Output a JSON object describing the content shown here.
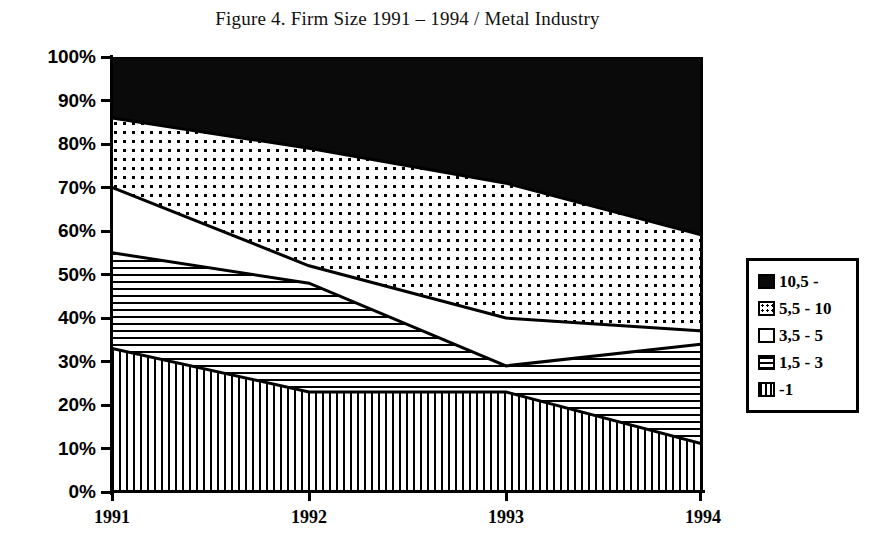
{
  "chart_data": {
    "type": "area",
    "title": "Figure 4. Firm Size 1991 – 1994 / Metal Industry",
    "xlabel": "",
    "ylabel": "",
    "categories": [
      "1991",
      "1992",
      "1993",
      "1994"
    ],
    "x": [
      1991,
      1992,
      1993,
      1994
    ],
    "ylim": [
      0,
      100
    ],
    "ytick_labels": [
      "0%",
      "10%",
      "20%",
      "30%",
      "40%",
      "50%",
      "60%",
      "70%",
      "80%",
      "90%",
      "100%"
    ],
    "ytick_values": [
      0,
      10,
      20,
      30,
      40,
      50,
      60,
      70,
      80,
      90,
      100
    ],
    "stacked": true,
    "normalized_percent": true,
    "grid": false,
    "legend_position": "right",
    "series": [
      {
        "name": "-1",
        "pattern": "vertical-lines",
        "values": [
          33,
          23,
          23,
          11
        ],
        "cumulative_top": [
          33,
          23,
          23,
          11
        ]
      },
      {
        "name": "1,5 - 3",
        "pattern": "horizontal-lines",
        "values": [
          22,
          25,
          6,
          23
        ],
        "cumulative_top": [
          55,
          48,
          29,
          34
        ]
      },
      {
        "name": "3,5 - 5",
        "pattern": "solid-white",
        "values": [
          15,
          4,
          11,
          3
        ],
        "cumulative_top": [
          70,
          52,
          40,
          37
        ]
      },
      {
        "name": "5,5 - 10",
        "pattern": "dotted",
        "values": [
          16,
          27,
          31,
          22
        ],
        "cumulative_top": [
          86,
          79,
          71,
          59
        ]
      },
      {
        "name": "10,5 -",
        "pattern": "solid-black",
        "values": [
          14,
          21,
          29,
          41
        ],
        "cumulative_top": [
          100,
          100,
          100,
          100
        ]
      }
    ]
  },
  "legend": {
    "items": [
      {
        "label": "10,5 -",
        "pattern": "solid-black"
      },
      {
        "label": "5,5 - 10",
        "pattern": "dotted"
      },
      {
        "label": "3,5 - 5",
        "pattern": "solid-white"
      },
      {
        "label": "1,5 - 3",
        "pattern": "horizontal-lines"
      },
      {
        "label": "-1",
        "pattern": "vertical-lines"
      }
    ]
  },
  "colors": {
    "foreground": "#000000",
    "background": "#ffffff"
  }
}
